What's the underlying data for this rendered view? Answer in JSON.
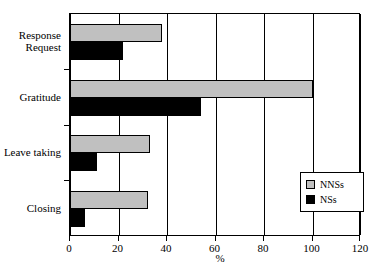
{
  "chart_data": {
    "type": "bar",
    "orientation": "horizontal",
    "title": "",
    "xlabel": "%",
    "ylabel": "",
    "xlim": [
      0,
      120
    ],
    "xticks": [
      0,
      20,
      40,
      60,
      80,
      100,
      120
    ],
    "grid": true,
    "grid_axis": "x",
    "legend_position": "lower right",
    "categories": [
      "Response Request",
      "Gratitude",
      "Leave taking",
      "Closing"
    ],
    "category_lines": [
      [
        "Response",
        "Request"
      ],
      [
        "Gratitude"
      ],
      [
        "Leave taking"
      ],
      [
        "Closing"
      ]
    ],
    "series": [
      {
        "name": "NNSs",
        "color": "#c0c0c0",
        "values": [
          38,
          100,
          33,
          32
        ]
      },
      {
        "name": "NSs",
        "color": "#000000",
        "values": [
          22,
          54,
          11,
          6
        ]
      }
    ]
  },
  "legend": {
    "items": [
      {
        "label": "NNSs",
        "swatch": "gray-swatch"
      },
      {
        "label": "NSs",
        "swatch": "black-swatch"
      }
    ]
  },
  "axis": {
    "x_title": "%",
    "tick_labels": [
      "0",
      "20",
      "40",
      "60",
      "80",
      "100",
      "120"
    ]
  },
  "caption": {
    "text": ""
  }
}
